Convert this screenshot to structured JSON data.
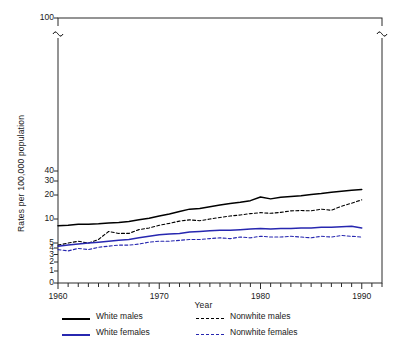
{
  "chart_data": {
    "type": "line",
    "title": "",
    "xlabel": "Year",
    "ylabel": "Rates per 100,000 population",
    "xlim": [
      1960,
      1992
    ],
    "ylim": [
      0,
      100
    ],
    "y_scale": "log-broken",
    "y_ticks": [
      "0",
      "1",
      "2",
      "3",
      "4",
      "5",
      "10",
      "20",
      "30",
      "40",
      "100"
    ],
    "y_ticks_labeled": [
      "0",
      "1",
      "2",
      "3",
      "4",
      "5",
      "10",
      "20",
      "30",
      "40",
      "100"
    ],
    "x_ticks": [
      "1960",
      "1970",
      "1980",
      "1990"
    ],
    "grid": false,
    "axis_break": "y-axis break between 40 and 100",
    "legend_position": "below-plot",
    "x": [
      1960,
      1961,
      1962,
      1963,
      1964,
      1965,
      1966,
      1967,
      1968,
      1969,
      1970,
      1971,
      1972,
      1973,
      1974,
      1975,
      1976,
      1977,
      1978,
      1979,
      1980,
      1981,
      1982,
      1983,
      1984,
      1985,
      1986,
      1987,
      1988,
      1989,
      1990
    ],
    "series": [
      {
        "name": "White males",
        "color": "#000000",
        "style": "solid",
        "values": [
          5.3,
          5.4,
          5.6,
          5.6,
          5.7,
          5.9,
          6.0,
          6.2,
          6.6,
          7.0,
          7.6,
          8.2,
          9.0,
          9.8,
          10.0,
          10.7,
          11.4,
          12.1,
          12.6,
          13.4,
          15.3,
          14.3,
          15.2,
          15.6,
          16.1,
          16.8,
          17.4,
          18.2,
          19.0,
          19.6,
          20.2
        ]
      },
      {
        "name": "Nonwhite males",
        "color": "#000000",
        "style": "dashed",
        "values": [
          2.6,
          2.8,
          3.0,
          2.8,
          3.2,
          4.3,
          4.0,
          4.0,
          4.6,
          4.9,
          5.4,
          5.8,
          6.3,
          6.6,
          6.4,
          6.8,
          7.2,
          7.6,
          7.9,
          8.3,
          8.6,
          8.4,
          8.7,
          9.2,
          9.3,
          9.2,
          9.8,
          9.4,
          10.9,
          12.2,
          13.8
        ]
      },
      {
        "name": "White females",
        "color": "#2727b0",
        "style": "solid",
        "values": [
          2.5,
          2.6,
          2.7,
          2.8,
          2.9,
          3.0,
          3.1,
          3.2,
          3.4,
          3.6,
          3.8,
          3.9,
          4.0,
          4.2,
          4.3,
          4.4,
          4.5,
          4.5,
          4.6,
          4.7,
          4.8,
          4.7,
          4.8,
          4.8,
          4.9,
          4.9,
          5.0,
          5.0,
          5.1,
          5.2,
          4.9
        ]
      },
      {
        "name": "Nonwhite females",
        "color": "#2727b0",
        "style": "dashed",
        "values": [
          2.2,
          2.1,
          2.3,
          2.2,
          2.4,
          2.5,
          2.6,
          2.6,
          2.7,
          2.9,
          3.0,
          3.0,
          3.1,
          3.2,
          3.2,
          3.3,
          3.4,
          3.3,
          3.5,
          3.4,
          3.6,
          3.5,
          3.5,
          3.6,
          3.5,
          3.4,
          3.6,
          3.5,
          3.7,
          3.6,
          3.5
        ]
      }
    ],
    "legend": [
      {
        "label": "White males",
        "color": "#000000",
        "style": "solid"
      },
      {
        "label": "Nonwhite males",
        "color": "#000000",
        "style": "dashed"
      },
      {
        "label": "White females",
        "color": "#2727b0",
        "style": "solid"
      },
      {
        "label": "Nonwhite females",
        "color": "#2727b0",
        "style": "dashed"
      }
    ]
  }
}
